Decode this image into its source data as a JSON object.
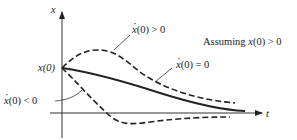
{
  "diagram": {
    "type": "response curves of x(t) for different initial velocities",
    "axes": {
      "vertical_label": "x",
      "horizontal_label": "t",
      "origin_value_label": "x(0)"
    },
    "curves": [
      {
        "id": "positive",
        "label_var": "x",
        "label_rest": "(0) > 0",
        "style": "dashed"
      },
      {
        "id": "zero",
        "label_var": "x",
        "label_rest": "(0) = 0",
        "style": "solid"
      },
      {
        "id": "negative",
        "label_var": "x",
        "label_rest": "(0) < 0",
        "style": "dashed"
      }
    ],
    "assumption": {
      "prefix": "Assuming ",
      "var": "x",
      "rest": "(0) > 0"
    }
  }
}
